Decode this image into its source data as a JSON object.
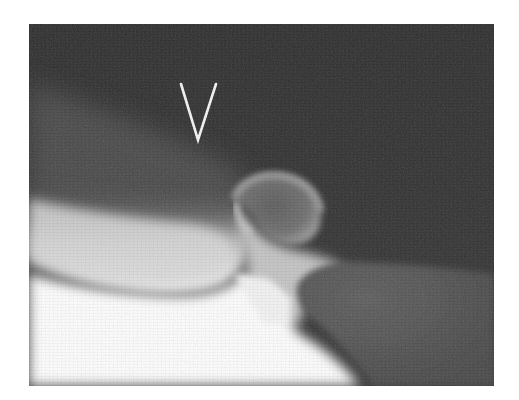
{
  "image": {
    "type": "radiograph",
    "modality": "x-ray",
    "colors": {
      "background_dark": "#2f2f2f",
      "soft_tissue_mid": "#7a7a7a",
      "bone_bright": "#ffffff",
      "marker": "#f2f2f2",
      "page_background": "#ffffff"
    },
    "marker": {
      "shape": "arrowhead-v",
      "label": "V"
    }
  }
}
